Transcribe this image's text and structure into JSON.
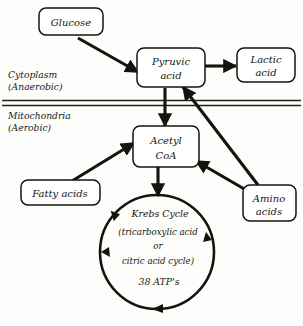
{
  "diagram": {
    "compartments": [
      {
        "id": "cytoplasm",
        "line1": "Cytoplasm",
        "line2": "(Anaerobic)"
      },
      {
        "id": "mitochondria",
        "line1": "Mitochondria",
        "line2": "(Aerobic)"
      }
    ],
    "nodes": [
      {
        "id": "glucose",
        "line1": "Glucose",
        "line2": ""
      },
      {
        "id": "pyruvic-acid",
        "line1": "Pyruvic",
        "line2": "acid"
      },
      {
        "id": "lactic-acid",
        "line1": "Lactic",
        "line2": "acid"
      },
      {
        "id": "acetyl-coa",
        "line1": "Acetyl",
        "line2": "CoA"
      },
      {
        "id": "fatty-acids",
        "line1": "Fatty acids",
        "line2": ""
      },
      {
        "id": "amino-acids",
        "line1": "Amino",
        "line2": "acids"
      }
    ],
    "cycle": {
      "id": "krebs-cycle",
      "line1": "Krebs Cycle",
      "line2": "(tricarboxylic acid",
      "line3": "or",
      "line4": "citric acid cycle)",
      "line5": "38 ATP's"
    },
    "colors": {
      "ink": "#14130e",
      "paper": "#fdfdfc"
    }
  }
}
